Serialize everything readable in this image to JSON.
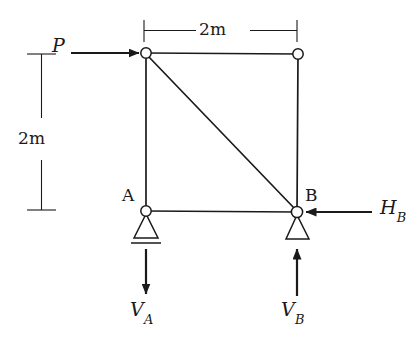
{
  "figure": {
    "background_color": "#ffffff",
    "line_color": "#1a1a1a",
    "width": 419,
    "height": 339
  },
  "dimensions": {
    "top_span": {
      "label": "2m",
      "value": 2,
      "unit": "m",
      "orientation": "horizontal"
    },
    "left_height": {
      "label": "2m",
      "value": 2,
      "unit": "m",
      "orientation": "vertical"
    }
  },
  "joints": [
    {
      "id": "top_left",
      "label": "",
      "x": 146,
      "y": 53
    },
    {
      "id": "top_right",
      "label": "",
      "x": 298,
      "y": 54
    },
    {
      "id": "A",
      "label": "A",
      "x": 146,
      "y": 211
    },
    {
      "id": "B",
      "label": "B",
      "x": 297,
      "y": 212
    }
  ],
  "members": [
    {
      "id": "top_chord",
      "from": "top_left",
      "to": "top_right"
    },
    {
      "id": "left_column",
      "from": "top_left",
      "to": "A"
    },
    {
      "id": "right_column",
      "from": "top_right",
      "to": "B"
    },
    {
      "id": "bottom_chord",
      "from": "A",
      "to": "B"
    },
    {
      "id": "diagonal",
      "from": "top_left",
      "to": "B"
    }
  ],
  "supports": [
    {
      "id": "support_A",
      "at": "A",
      "type": "pin-with-ground-line"
    },
    {
      "id": "support_B",
      "at": "B",
      "type": "pin"
    }
  ],
  "forces": {
    "P": {
      "label": "P",
      "sub": "",
      "direction": "right",
      "applied_at": "top_left"
    },
    "HB": {
      "label": "H",
      "sub": "B",
      "direction": "left",
      "applied_at": "B"
    },
    "VA": {
      "label": "V",
      "sub": "A",
      "direction": "down",
      "applied_at": "A"
    },
    "VB": {
      "label": "V",
      "sub": "B",
      "direction": "up",
      "applied_at": "B"
    }
  }
}
